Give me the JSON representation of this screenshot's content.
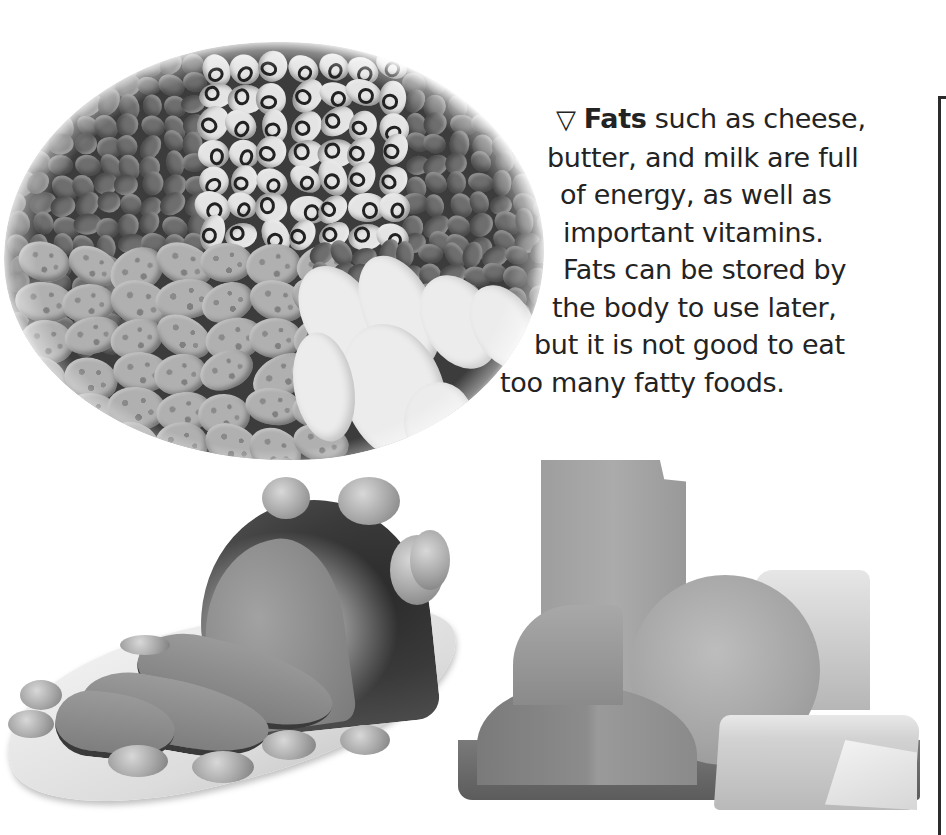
{
  "page": {
    "layout": "textbook spread fragment",
    "margin_rule": true
  },
  "caption": {
    "marker_icon": "down-pointing-triangle",
    "marker_glyph": "▽",
    "bold_term": "Fats",
    "lines": [
      " such as cheese,",
      "butter, and milk are full",
      "of energy, as well as",
      "important vitamins.",
      "Fats can be stored by",
      "the body to use later,",
      "but it is not good to eat",
      "too many fatty foods."
    ],
    "full_text": "Fats such as cheese, butter, and milk are full of energy, as well as important vitamins. Fats can be stored by the body to use later, but it is not good to eat too many fatty foods."
  },
  "images": [
    {
      "name": "beans-photo",
      "subject": "assorted dried beans (adzuki, black-eyed peas, pinto, white kidney beans)",
      "tone": "grayscale"
    },
    {
      "name": "roast-meat-photo",
      "subject": "sliced roast meat on platter with small onions",
      "tone": "grayscale"
    },
    {
      "name": "cheese-photo",
      "subject": "assorted cheeses on a board (block, wheel, wedges, brie)",
      "tone": "grayscale"
    }
  ],
  "colors": {
    "text": "#232323",
    "rule": "#2b2b2b",
    "background": "#ffffff"
  }
}
